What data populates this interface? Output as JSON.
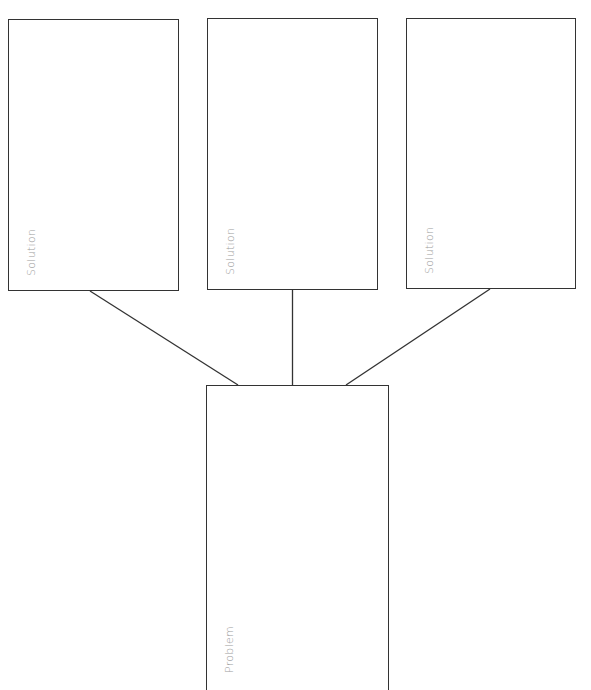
{
  "diagram": {
    "type": "problem-solution-tree",
    "colors": {
      "stroke": "#333333",
      "label": "#9a9a9a",
      "background": "#ffffff"
    },
    "solutions": [
      {
        "label": "Solution",
        "x": 8,
        "y": 19,
        "w": 171,
        "h": 272
      },
      {
        "label": "Solution",
        "x": 207,
        "y": 18,
        "w": 171,
        "h": 272
      },
      {
        "label": "Solution",
        "x": 406,
        "y": 18,
        "w": 170,
        "h": 271
      }
    ],
    "problem": {
      "label": "Problem",
      "x": 206,
      "y": 385,
      "w": 183,
      "h": 305
    },
    "connectors": [
      {
        "from": "solution-1",
        "x1": 90,
        "y1": 291,
        "x2": 238,
        "y2": 385
      },
      {
        "from": "solution-2",
        "x1": 292.5,
        "y1": 290,
        "x2": 292.5,
        "y2": 385
      },
      {
        "from": "solution-3",
        "x1": 490,
        "y1": 289,
        "x2": 346,
        "y2": 385
      }
    ]
  }
}
